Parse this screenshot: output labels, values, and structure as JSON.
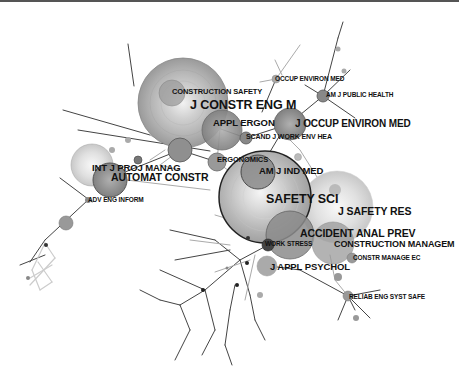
{
  "diagram": {
    "type": "journal co-citation network",
    "colors": {
      "background": "#ffffff",
      "edge_dark": "#444444",
      "edge_light": "#bbbbbb",
      "node_fill": "#999999",
      "label": "#111111"
    },
    "nodes": [
      {
        "id": "jcem",
        "label": "J CONSTR ENG M",
        "x": 183,
        "y": 103,
        "r": 45,
        "font": 12
      },
      {
        "id": "cs",
        "label": "CONSTRUCTION SAFETY",
        "x": 172,
        "y": 93,
        "r": 12,
        "font": 7
      },
      {
        "id": "ae",
        "label": "APPL ERGON",
        "x": 220,
        "y": 128,
        "r": 20,
        "font": 9
      },
      {
        "id": "om",
        "label": "OCCUP ENVIRON MED",
        "x": 276,
        "y": 79,
        "r": 4,
        "font": 6
      },
      {
        "id": "ajph",
        "label": "AM J PUBLIC HEALTH",
        "x": 323,
        "y": 96,
        "r": 6,
        "font": 6
      },
      {
        "id": "joem",
        "label": "J OCCUP ENVIRON MED",
        "x": 289,
        "y": 124,
        "r": 16,
        "font": 9
      },
      {
        "id": "sjweh",
        "label": "SCAND J WORK ENV HEA",
        "x": 246,
        "y": 138,
        "r": 6,
        "font": 6.5
      },
      {
        "id": "ijpm",
        "label": "INT J PROJ MANAG",
        "x": 88,
        "y": 165,
        "r": 20,
        "font": 8.5
      },
      {
        "id": "ac",
        "label": "AUTOMAT CONSTR",
        "x": 110,
        "y": 178,
        "r": 17,
        "font": 9.5
      },
      {
        "id": "erg",
        "label": "ERGONOMICS",
        "x": 217,
        "y": 162,
        "r": 9,
        "font": 7
      },
      {
        "id": "ajim",
        "label": "AM J IND MED",
        "x": 258,
        "y": 172,
        "r": 17,
        "font": 8.5
      },
      {
        "id": "ss",
        "label": "SAFETY SCI",
        "x": 265,
        "y": 198,
        "r": 46,
        "font": 12
      },
      {
        "id": "jsr",
        "label": "J SAFETY RES",
        "x": 336,
        "y": 207,
        "r": 36,
        "font": 10
      },
      {
        "id": "aap",
        "label": "ACCIDENT ANAL PREV",
        "x": 288,
        "y": 235,
        "r": 24,
        "font": 10
      },
      {
        "id": "cm",
        "label": "CONSTRUCTION MANAGEM",
        "x": 335,
        "y": 245,
        "r": 22,
        "font": 8.5
      },
      {
        "id": "ws",
        "label": "WORK STRESS",
        "x": 268,
        "y": 245,
        "r": 7,
        "font": 6
      },
      {
        "id": "cmec",
        "label": "CONSTR MANAGE EC",
        "x": 352,
        "y": 257,
        "r": 6,
        "font": 6.5
      },
      {
        "id": "jap",
        "label": "J APPL PSYCHOL",
        "x": 268,
        "y": 267,
        "r": 11,
        "font": 9
      },
      {
        "id": "aei",
        "label": "ADV ENG INFORM",
        "x": 88,
        "y": 200,
        "r": 4,
        "font": 6
      },
      {
        "id": "ress",
        "label": "RELIAB ENG SYST SAFE",
        "x": 348,
        "y": 296,
        "r": 5,
        "font": 6.5
      }
    ],
    "labels": [
      {
        "text": "CONSTRUCTION SAFETY",
        "x": 172,
        "y": 88,
        "size": 7.5
      },
      {
        "text": "J CONSTR ENG M",
        "x": 190,
        "y": 102,
        "size": 12.5
      },
      {
        "text": "APPL ERGON",
        "x": 213,
        "y": 120,
        "size": 9.5
      },
      {
        "text": "OCCUP ENVIRON MED",
        "x": 275,
        "y": 76,
        "size": 6.5
      },
      {
        "text": "AM J PUBLIC HEALTH",
        "x": 325,
        "y": 93,
        "size": 6.5
      },
      {
        "text": "J OCCUP ENVIRON MED",
        "x": 295,
        "y": 121,
        "size": 10
      },
      {
        "text": "SCAND J WORK ENV HEA",
        "x": 245,
        "y": 134,
        "size": 7
      },
      {
        "text": "INT J PROJ MANAG",
        "x": 92,
        "y": 163,
        "size": 9.5
      },
      {
        "text": "AUTOMAT CONSTR",
        "x": 111,
        "y": 172,
        "size": 10.5
      },
      {
        "text": "ADV ENG INFORM",
        "x": 88,
        "y": 197,
        "size": 6.5
      },
      {
        "text": "ERGONOMICS",
        "x": 217,
        "y": 157,
        "size": 7.5
      },
      {
        "text": "AM J IND MED",
        "x": 258,
        "y": 166,
        "size": 9.5
      },
      {
        "text": "SAFETY SCI",
        "x": 266,
        "y": 196,
        "size": 12.5
      },
      {
        "text": "J SAFETY RES",
        "x": 336,
        "y": 209,
        "size": 10.5
      },
      {
        "text": "ACCIDENT ANAL PREV",
        "x": 300,
        "y": 230,
        "size": 10.5
      },
      {
        "text": "WORK STRESS",
        "x": 264,
        "y": 242,
        "size": 6.5
      },
      {
        "text": "CONSTRUCTION MANAGEM",
        "x": 333,
        "y": 241,
        "size": 9
      },
      {
        "text": "CONSTR MANAGE EC",
        "x": 353,
        "y": 256,
        "size": 6.5
      },
      {
        "text": "J APPL PSYCHOL",
        "x": 270,
        "y": 262,
        "size": 9.5
      },
      {
        "text": "RELIAB ENG SYST SAFE",
        "x": 349,
        "y": 294,
        "size": 6.5
      }
    ]
  }
}
